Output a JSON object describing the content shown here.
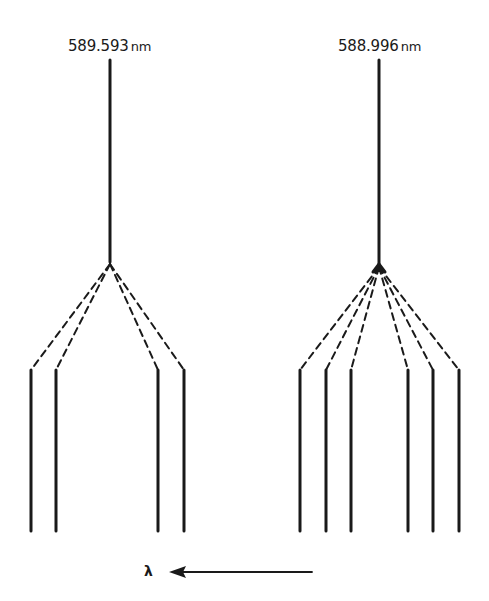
{
  "diagram": {
    "lines": [
      {
        "wavelength": "589.593",
        "unit": "nm",
        "components": 4
      },
      {
        "wavelength": "588.996",
        "unit": "nm",
        "components": 6
      }
    ],
    "axis": {
      "symbol": "λ",
      "direction": "decreasing to the left"
    }
  },
  "colors": {
    "ink": "#1a1a1a",
    "background": "#ffffff"
  }
}
